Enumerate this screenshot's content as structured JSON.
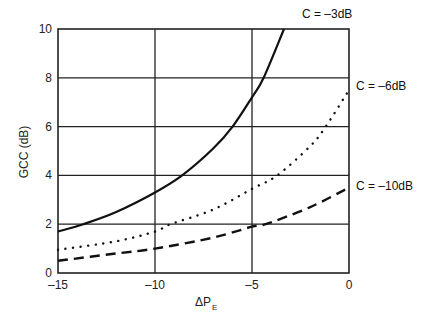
{
  "chart_data": {
    "type": "line",
    "title": "",
    "xlabel": "ΔP",
    "xlabel_subscript": "E",
    "ylabel": "GCC (dB)",
    "xlim": [
      -15,
      0
    ],
    "ylim": [
      0,
      10
    ],
    "grid": true,
    "x_ticks": [
      -15,
      -10,
      -5,
      0
    ],
    "x_tick_labels": [
      "–15",
      "–10",
      "–5",
      "0"
    ],
    "y_ticks": [
      0,
      2,
      4,
      6,
      8,
      10
    ],
    "y_tick_labels": [
      "0",
      "2",
      "4",
      "6",
      "8",
      "10"
    ],
    "legend_position": "inline curve labels at right",
    "series": [
      {
        "name": "C = –3dB",
        "style": "solid",
        "x": [
          -15,
          -13.7,
          -12,
          -10,
          -8.6,
          -7,
          -6,
          -5,
          -4.4,
          -3.35
        ],
        "y": [
          1.7,
          2.0,
          2.5,
          3.3,
          4.0,
          5.1,
          6.0,
          7.2,
          8.0,
          10.0
        ]
      },
      {
        "name": "C = –6dB",
        "style": "dotted",
        "x": [
          -15,
          -12,
          -10,
          -9.2,
          -7,
          -5,
          -3.7,
          -2,
          -1.2,
          0
        ],
        "y": [
          0.95,
          1.3,
          1.7,
          2.0,
          2.6,
          3.45,
          4.0,
          5.2,
          6.0,
          7.5
        ]
      },
      {
        "name": "C = –10dB",
        "style": "dashed",
        "x": [
          -15,
          -12,
          -10,
          -7,
          -5,
          -4.3,
          -2,
          0
        ],
        "y": [
          0.5,
          0.8,
          1.0,
          1.45,
          1.9,
          2.0,
          2.7,
          3.5
        ]
      }
    ]
  },
  "labels": {
    "c3": "C = –3dB",
    "c6": "C = –6dB",
    "c10": "C = –10dB",
    "ylabel": "GCC (dB)",
    "xlabel_main": "ΔP",
    "xlabel_sub": "E"
  },
  "colors": {
    "axis": "#222222",
    "curve": "#111111",
    "background": "#ffffff"
  }
}
